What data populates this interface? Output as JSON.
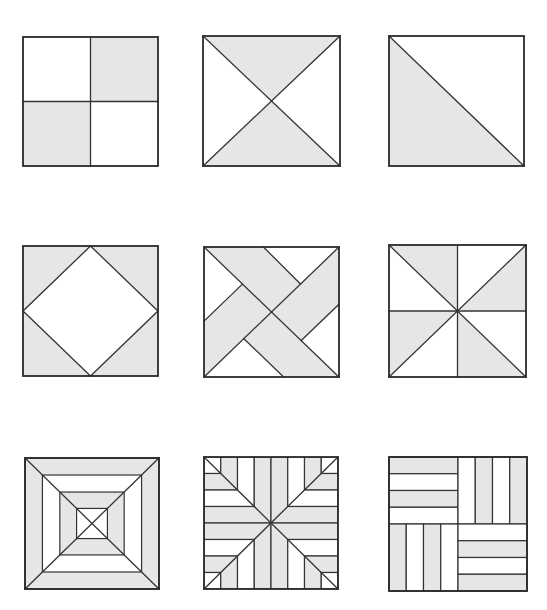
{
  "colors": {
    "background": "#ffffff",
    "shade": "#e6e6e6",
    "light": "#ffffff",
    "stroke": "#333333",
    "border": "#2a2a2a"
  },
  "blocks": [
    {
      "id": "four-patch",
      "name": "four-patch-block",
      "box": {
        "x": 23,
        "y": 37,
        "w": 135,
        "h": 129
      },
      "shaded": [
        [
          [
            0.5,
            0
          ],
          [
            1,
            0
          ],
          [
            1,
            0.5
          ],
          [
            0.5,
            0.5
          ]
        ],
        [
          [
            0,
            0.5
          ],
          [
            0.5,
            0.5
          ],
          [
            0.5,
            1
          ],
          [
            0,
            1
          ]
        ]
      ],
      "lines": [
        [
          [
            0.5,
            0
          ],
          [
            0.5,
            1
          ]
        ],
        [
          [
            0,
            0.5
          ],
          [
            1,
            0.5
          ]
        ]
      ]
    },
    {
      "id": "hourglass",
      "name": "hourglass-block",
      "box": {
        "x": 203,
        "y": 36,
        "w": 137,
        "h": 130
      },
      "shaded": [
        [
          [
            0,
            0
          ],
          [
            1,
            0
          ],
          [
            0.5,
            0.5
          ]
        ],
        [
          [
            0,
            1
          ],
          [
            1,
            1
          ],
          [
            0.5,
            0.5
          ]
        ]
      ],
      "lines": [
        [
          [
            0,
            0
          ],
          [
            1,
            1
          ]
        ],
        [
          [
            1,
            0
          ],
          [
            0,
            1
          ]
        ]
      ]
    },
    {
      "id": "half-square-triangle",
      "name": "half-square-triangle-block",
      "box": {
        "x": 389,
        "y": 36,
        "w": 135,
        "h": 130
      },
      "shaded": [
        [
          [
            0,
            0
          ],
          [
            1,
            1
          ],
          [
            0,
            1
          ]
        ]
      ],
      "lines": [
        [
          [
            0,
            0
          ],
          [
            1,
            1
          ]
        ]
      ]
    },
    {
      "id": "square-in-square",
      "name": "square-in-square-block",
      "box": {
        "x": 23,
        "y": 246,
        "w": 135,
        "h": 130
      },
      "shaded": [
        [
          [
            0,
            0
          ],
          [
            0.5,
            0
          ],
          [
            0,
            0.5
          ]
        ],
        [
          [
            0.5,
            0
          ],
          [
            1,
            0
          ],
          [
            1,
            0.5
          ]
        ],
        [
          [
            1,
            0.5
          ],
          [
            1,
            1
          ],
          [
            0.5,
            1
          ]
        ],
        [
          [
            0,
            0.5
          ],
          [
            0.5,
            1
          ],
          [
            0,
            1
          ]
        ]
      ],
      "lines": [
        [
          [
            0.5,
            0
          ],
          [
            1,
            0.5
          ]
        ],
        [
          [
            1,
            0.5
          ],
          [
            0.5,
            1
          ]
        ],
        [
          [
            0.5,
            1
          ],
          [
            0,
            0.5
          ]
        ],
        [
          [
            0,
            0.5
          ],
          [
            0.5,
            0
          ]
        ]
      ]
    },
    {
      "id": "interwoven-bands",
      "name": "interwoven-bands-block",
      "box": {
        "x": 204,
        "y": 247,
        "w": 135,
        "h": 130
      },
      "shaded": [
        [
          [
            0,
            0
          ],
          [
            1,
            0
          ],
          [
            1,
            1
          ],
          [
            0,
            1
          ]
        ]
      ],
      "light": [
        [
          [
            0,
            0
          ],
          [
            0.285,
            0.285
          ],
          [
            0,
            0.57
          ]
        ],
        [
          [
            0.44,
            0
          ],
          [
            1,
            0
          ],
          [
            0.715,
            0.285
          ]
        ],
        [
          [
            1,
            0.44
          ],
          [
            1,
            1
          ],
          [
            0.72,
            0.72
          ]
        ],
        [
          [
            0,
            1
          ],
          [
            0.59,
            1
          ],
          [
            0.295,
            0.705
          ]
        ]
      ],
      "lines": [
        [
          [
            0,
            0
          ],
          [
            1,
            1
          ]
        ],
        [
          [
            1,
            0
          ],
          [
            0,
            1
          ]
        ],
        [
          [
            0.44,
            0
          ],
          [
            0.715,
            0.285
          ]
        ],
        [
          [
            0,
            0.57
          ],
          [
            0.285,
            0.285
          ]
        ],
        [
          [
            1,
            0.44
          ],
          [
            0.72,
            0.72
          ]
        ],
        [
          [
            0.59,
            1
          ],
          [
            0.295,
            0.705
          ]
        ]
      ]
    },
    {
      "id": "pinwheel",
      "name": "pinwheel-block",
      "box": {
        "x": 389,
        "y": 245,
        "w": 137,
        "h": 132
      },
      "shaded": [
        [
          [
            0,
            0
          ],
          [
            0.5,
            0
          ],
          [
            0.5,
            0.5
          ]
        ],
        [
          [
            1,
            0
          ],
          [
            1,
            0.5
          ],
          [
            0.5,
            0.5
          ]
        ],
        [
          [
            0,
            0.5
          ],
          [
            0.5,
            0.5
          ],
          [
            0,
            1
          ]
        ],
        [
          [
            0.5,
            0.5
          ],
          [
            0.5,
            1
          ],
          [
            1,
            1
          ]
        ]
      ],
      "lines": [
        [
          [
            0.5,
            0
          ],
          [
            0.5,
            1
          ]
        ],
        [
          [
            0,
            0.5
          ],
          [
            1,
            0.5
          ]
        ],
        [
          [
            0,
            0
          ],
          [
            1,
            1
          ]
        ],
        [
          [
            1,
            0
          ],
          [
            0,
            1
          ]
        ]
      ]
    },
    {
      "id": "concentric-squares",
      "name": "concentric-squares-block",
      "box": {
        "x": 25,
        "y": 458,
        "w": 134,
        "h": 131
      },
      "rings": [
        {
          "inset": 0,
          "fill": "shade"
        },
        {
          "inset": 0.13,
          "fill": "light"
        },
        {
          "inset": 0.26,
          "fill": "shade"
        },
        {
          "inset": 0.385,
          "fill": "light"
        }
      ],
      "lines": [
        [
          [
            0,
            0
          ],
          [
            1,
            1
          ]
        ],
        [
          [
            1,
            0
          ],
          [
            0,
            1
          ]
        ]
      ]
    },
    {
      "id": "strip-star",
      "name": "strip-star-block",
      "box": {
        "x": 204,
        "y": 457,
        "w": 134,
        "h": 132
      },
      "strips": 8,
      "strip_pattern": [
        "light",
        "shade",
        "light",
        "shade",
        "shade",
        "light",
        "shade",
        "light"
      ],
      "lines": [
        [
          [
            0,
            0
          ],
          [
            1,
            1
          ]
        ],
        [
          [
            1,
            0
          ],
          [
            0,
            1
          ]
        ]
      ]
    },
    {
      "id": "rail-fence",
      "name": "rail-fence-block",
      "box": {
        "x": 389,
        "y": 457,
        "w": 138,
        "h": 134
      },
      "quadrants": [
        {
          "pos": "tl",
          "orient": "h",
          "pattern": [
            "shade",
            "light",
            "shade",
            "light"
          ]
        },
        {
          "pos": "tr",
          "orient": "v",
          "pattern": [
            "light",
            "shade",
            "light",
            "shade"
          ]
        },
        {
          "pos": "bl",
          "orient": "v",
          "pattern": [
            "shade",
            "light",
            "shade",
            "light"
          ]
        },
        {
          "pos": "br",
          "orient": "h",
          "pattern": [
            "light",
            "shade",
            "light",
            "shade"
          ]
        }
      ]
    }
  ]
}
